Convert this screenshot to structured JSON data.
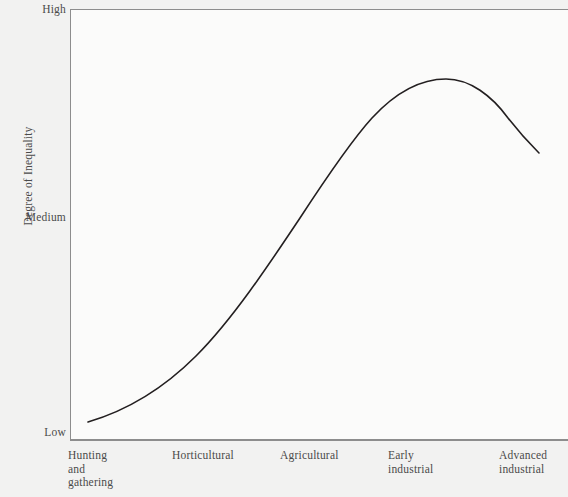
{
  "chart_data": {
    "type": "line",
    "title": "",
    "xlabel": "",
    "ylabel": "Degree of Inequality",
    "categories": [
      "Hunting and gathering",
      "Horticultural",
      "Agricultural",
      "Early industrial",
      "Advanced industrial"
    ],
    "x_tick_labels": [
      "Hunting\nand\ngathering",
      "Horticultural",
      "Agricultural",
      "Early\nindustrial",
      "Advanced\nindustrial"
    ],
    "y_tick_labels": [
      "High",
      "Medium",
      "Low"
    ],
    "ylim": [
      "Low",
      "High"
    ],
    "grid": false,
    "legend": "none",
    "series": [
      {
        "name": "Degree of inequality",
        "points": [
          {
            "x": "Hunting and gathering",
            "y": 0.04
          },
          {
            "x": "Horticultural",
            "y": 0.26
          },
          {
            "x": "Agricultural",
            "y": 0.55
          },
          {
            "x": "Early industrial",
            "y": 0.9
          },
          {
            "x": "Advanced industrial",
            "y": 0.7
          }
        ],
        "values": [
          0.04,
          0.26,
          0.55,
          0.9,
          0.7
        ],
        "peak_at": "Early industrial",
        "shape": "inverted-U"
      }
    ],
    "curve_path": "M 88 422 C 122 412, 160 392, 196 356 C 232 320, 268 266, 300 218 C 330 172, 352 140, 372 118 C 396 92, 420 79, 446 79 C 470 79, 492 96, 508 118 C 522 136, 532 146, 539 153",
    "colors": {
      "curve": "#231f20",
      "axis": "#8d8d8d",
      "text": "#4a4a4a",
      "plot_background": "#fbfbfa",
      "page_background": "#f2f2f1"
    }
  },
  "axes": {
    "y_title": "Degree of Inequality",
    "y_ticks": {
      "high": "High",
      "medium": "Medium",
      "low": "Low"
    },
    "x_ticks": [
      "Hunting\nand\ngathering",
      "Horticultural",
      "Agricultural",
      "Early\nindustrial",
      "Advanced\nindustrial"
    ]
  }
}
